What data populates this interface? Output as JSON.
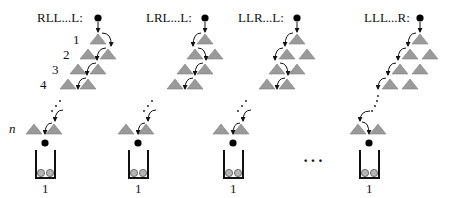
{
  "diagram": {
    "type": "galton-board-paths",
    "colors": {
      "peg_fill": "#9a9a9a",
      "peg_stroke": "#7a7a7a",
      "ball": "#000000",
      "bin_ball_fill": "#b0b0b0",
      "arrow": "#111111",
      "bin": "#111111"
    },
    "row_labels": [
      "1",
      "2",
      "3",
      "4"
    ],
    "last_row_label": "n",
    "between_columns_ellipsis": "···",
    "columns": [
      {
        "path_label": "RLL...L:",
        "bin_count": "1",
        "first_turn": "R"
      },
      {
        "path_label": "LRL...L:",
        "bin_count": "1",
        "second_turn": "R"
      },
      {
        "path_label": "LLR...L:",
        "bin_count": "1",
        "third_turn": "R"
      },
      {
        "path_label": "LLL...R:",
        "bin_count": "1",
        "last_turn": "R"
      }
    ]
  }
}
